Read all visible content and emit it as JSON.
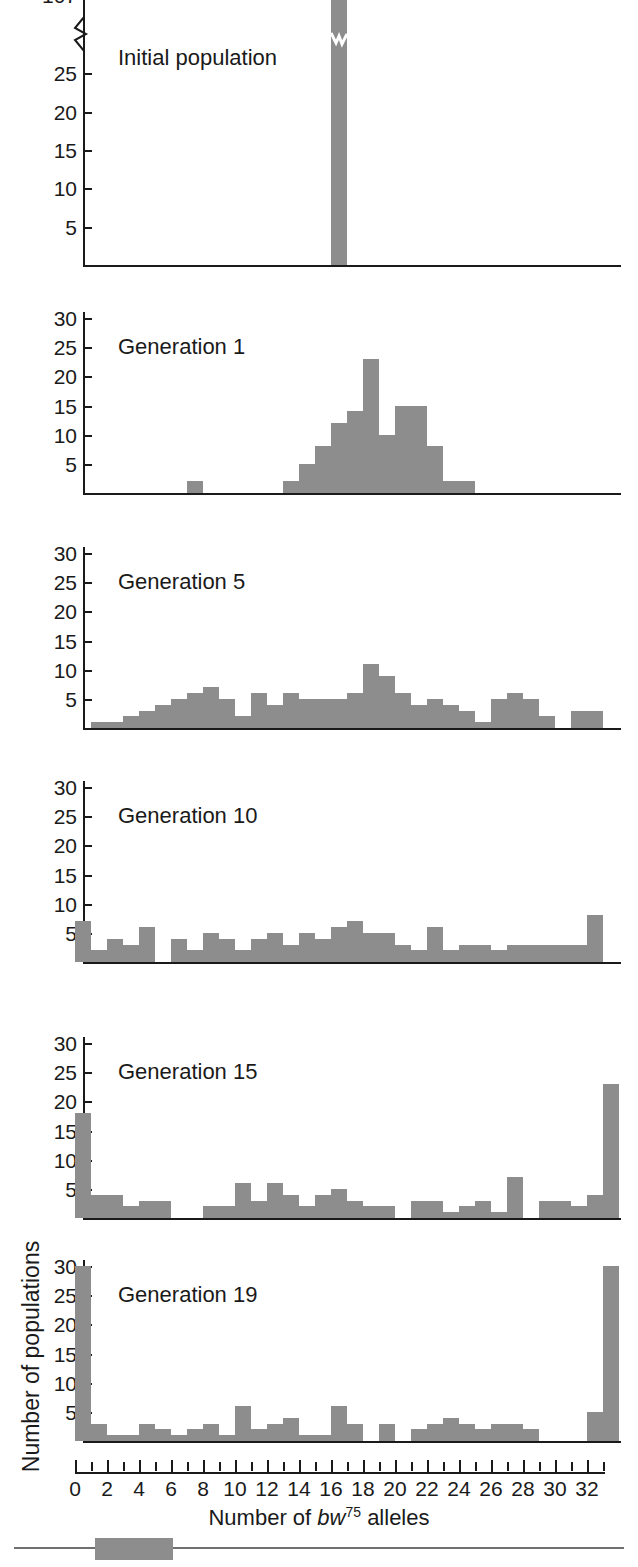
{
  "figure": {
    "x_axis_title_prefix": "Number of ",
    "x_axis_gene_italic": "bw",
    "x_axis_gene_sup": "75",
    "x_axis_title_suffix": " alleles",
    "y_axis_title": "Number of populations",
    "bar_color": "#8d8d8d",
    "axis_color": "#1a1a1a",
    "background_color": "#ffffff"
  },
  "chart_data": {
    "type": "bar",
    "title": "",
    "xlabel": "Number of bw75 alleles",
    "ylabel": "Number of populations",
    "grid": false,
    "legend": "none",
    "x": [
      0,
      1,
      2,
      3,
      4,
      5,
      6,
      7,
      8,
      9,
      10,
      11,
      12,
      13,
      14,
      15,
      16,
      17,
      18,
      19,
      20,
      21,
      22,
      23,
      24,
      25,
      26,
      27,
      28,
      29,
      30,
      31,
      32
    ],
    "x_tick_labels": [
      "0",
      "2",
      "4",
      "6",
      "8",
      "10",
      "12",
      "14",
      "16",
      "18",
      "20",
      "22",
      "24",
      "26",
      "28",
      "30",
      "32"
    ],
    "x_tick_values": [
      0,
      2,
      4,
      6,
      8,
      10,
      12,
      14,
      16,
      18,
      20,
      22,
      24,
      26,
      28,
      30,
      32
    ],
    "panels": [
      {
        "label": "Initial population",
        "ylim": [
          0,
          30
        ],
        "y_tick_labels": [
          "5",
          "10",
          "15",
          "20",
          "25",
          "107"
        ],
        "y_tick_values": [
          5,
          10,
          15,
          20,
          25,
          30
        ],
        "axis_broken": true,
        "broken_tick_label": "107",
        "broken_tick_real_value": 107,
        "values": [
          0,
          0,
          0,
          0,
          0,
          0,
          0,
          0,
          0,
          0,
          0,
          0,
          0,
          0,
          0,
          0,
          107,
          0,
          0,
          0,
          0,
          0,
          0,
          0,
          0,
          0,
          0,
          0,
          0,
          0,
          0,
          0,
          0
        ]
      },
      {
        "label": "Generation 1",
        "ylim": [
          0,
          30
        ],
        "y_tick_labels": [
          "5",
          "10",
          "15",
          "20",
          "25",
          "30"
        ],
        "y_tick_values": [
          5,
          10,
          15,
          20,
          25,
          30
        ],
        "axis_broken": false,
        "values": [
          0,
          0,
          0,
          0,
          0,
          0,
          0,
          2,
          0,
          0,
          0,
          0,
          0,
          2,
          5,
          8,
          12,
          14,
          23,
          10,
          15,
          15,
          8,
          2,
          2,
          0,
          0,
          0,
          0,
          0,
          0,
          0,
          0
        ]
      },
      {
        "label": "Generation 5",
        "ylim": [
          0,
          30
        ],
        "y_tick_labels": [
          "5",
          "10",
          "15",
          "20",
          "25",
          "30"
        ],
        "y_tick_values": [
          5,
          10,
          15,
          20,
          25,
          30
        ],
        "axis_broken": false,
        "values": [
          0,
          1,
          1,
          2,
          3,
          4,
          5,
          6,
          7,
          5,
          2,
          6,
          4,
          6,
          5,
          5,
          5,
          6,
          11,
          9,
          6,
          4,
          5,
          4,
          3,
          1,
          5,
          6,
          5,
          2,
          0,
          3,
          3
        ]
      },
      {
        "label": "Generation 10",
        "ylim": [
          0,
          30
        ],
        "y_tick_labels": [
          "5",
          "10",
          "15",
          "20",
          "25",
          "30"
        ],
        "y_tick_values": [
          5,
          10,
          15,
          20,
          25,
          30
        ],
        "axis_broken": false,
        "values": [
          7,
          2,
          4,
          3,
          6,
          0,
          4,
          2,
          5,
          4,
          2,
          4,
          5,
          3,
          5,
          4,
          6,
          7,
          5,
          5,
          3,
          2,
          6,
          2,
          3,
          3,
          2,
          3,
          3,
          3,
          3,
          3,
          8
        ]
      },
      {
        "label": "Generation 15",
        "ylim": [
          0,
          30
        ],
        "y_tick_labels": [
          "5",
          "10",
          "15",
          "20",
          "25",
          "30"
        ],
        "y_tick_values": [
          5,
          10,
          15,
          20,
          25,
          30
        ],
        "axis_broken": false,
        "values": [
          18,
          4,
          4,
          2,
          3,
          3,
          0,
          0,
          2,
          2,
          6,
          3,
          6,
          4,
          2,
          4,
          5,
          3,
          2,
          2,
          0,
          3,
          3,
          1,
          2,
          3,
          1,
          7,
          0,
          3,
          3,
          2,
          4,
          23
        ]
      },
      {
        "label": "Generation 19",
        "ylim": [
          0,
          30
        ],
        "y_tick_labels": [
          "5",
          "10",
          "15",
          "20",
          "25",
          "30"
        ],
        "y_tick_values": [
          5,
          10,
          15,
          20,
          25,
          30
        ],
        "axis_broken": false,
        "values": [
          30,
          3,
          1,
          1,
          3,
          2,
          1,
          2,
          3,
          1,
          6,
          2,
          3,
          4,
          1,
          1,
          6,
          3,
          0,
          3,
          0,
          2,
          3,
          4,
          3,
          2,
          3,
          3,
          2,
          0,
          0,
          0,
          5,
          30
        ]
      }
    ]
  }
}
